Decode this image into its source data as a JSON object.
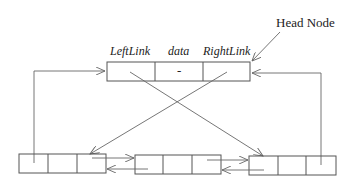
{
  "diagram": {
    "head_label": "Head Node",
    "field_labels": {
      "left": "LeftLink",
      "data": "data",
      "right": "RightLink"
    },
    "head_node": {
      "data_value": "-"
    },
    "nodes": [
      {
        "id": "node-1",
        "fields": [
          "",
          "",
          ""
        ]
      },
      {
        "id": "node-2",
        "fields": [
          "",
          "",
          ""
        ]
      },
      {
        "id": "node-3",
        "fields": [
          "",
          "",
          ""
        ]
      }
    ],
    "colors": {
      "stroke": "#555555",
      "text": "#222222",
      "background": "#ffffff"
    }
  }
}
